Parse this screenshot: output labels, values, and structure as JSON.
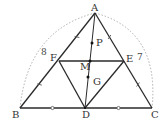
{
  "diagram": {
    "type": "geometry-triangle",
    "points": {
      "A": {
        "label": "A"
      },
      "B": {
        "label": "B"
      },
      "C": {
        "label": "C"
      },
      "D": {
        "label": "D"
      },
      "E": {
        "label": "E"
      },
      "F": {
        "label": "F"
      },
      "M": {
        "label": "M"
      },
      "P": {
        "label": "P"
      },
      "G": {
        "label": "G"
      }
    },
    "segments": [
      [
        "A",
        "B"
      ],
      [
        "A",
        "C"
      ],
      [
        "B",
        "C"
      ],
      [
        "F",
        "E"
      ],
      [
        "F",
        "D"
      ],
      [
        "E",
        "D"
      ],
      [
        "A",
        "D"
      ]
    ],
    "marked_points": [
      "P",
      "M",
      "G"
    ],
    "arc_labels": {
      "left": "8",
      "right": "7"
    },
    "equal_marks": {
      "slash": [
        [
          "A",
          "F"
        ],
        [
          "F",
          "B"
        ],
        [
          "A",
          "E"
        ],
        [
          "E",
          "C"
        ]
      ],
      "circle": [
        [
          "B",
          "D"
        ],
        [
          "D",
          "C"
        ]
      ]
    },
    "colors": {
      "line": "#2a2a2a",
      "arc": "#9a9a9a",
      "text": "#333333"
    }
  }
}
